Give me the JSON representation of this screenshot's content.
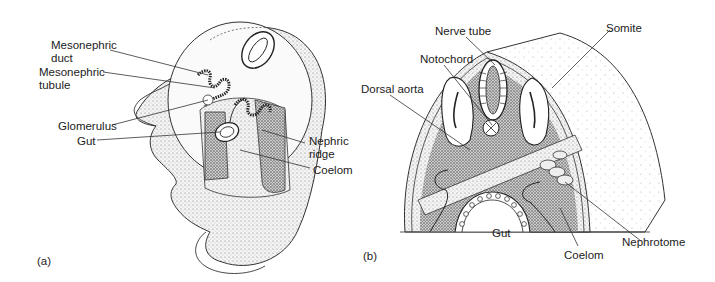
{
  "figure": {
    "panel_a": {
      "tag": "(a)",
      "labels": {
        "mesonephric_duct_1": "Mesonephric",
        "mesonephric_duct_2": "duct",
        "mesonephric_tubule_1": "Mesonephric",
        "mesonephric_tubule_2": "tubule",
        "glomerulus": "Glomerulus",
        "gut": "Gut",
        "nephric_ridge_1": "Nephric",
        "nephric_ridge_2": "ridge",
        "coelom": "Coelom"
      }
    },
    "panel_b": {
      "tag": "(b)",
      "labels": {
        "nerve_tube": "Nerve tube",
        "somite": "Somite",
        "notochord": "Notochord",
        "dorsal_aorta": "Dorsal aorta",
        "gut": "Gut",
        "coelom": "Coelom",
        "nephrotome": "Nephrotome"
      }
    }
  }
}
